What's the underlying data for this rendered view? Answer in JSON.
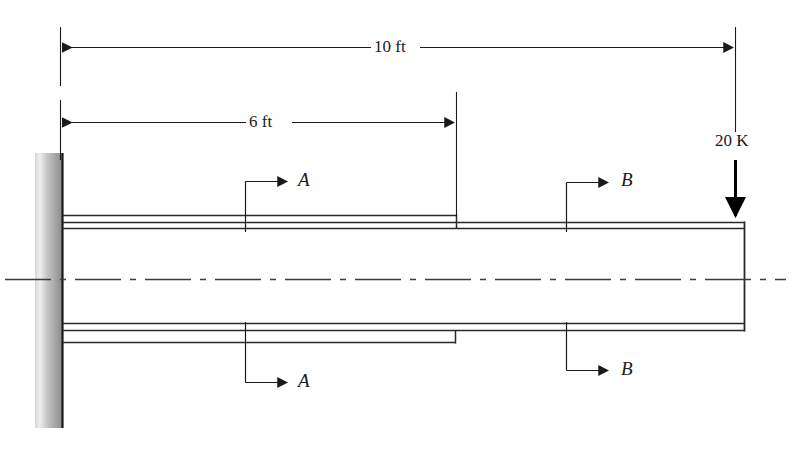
{
  "figure": {
    "background_color": "#ffffff",
    "line_color": "#1a1a1a",
    "wall_color_light": "#e8e8e8",
    "wall_color_dark": "#8a8a8a",
    "width": 793,
    "height": 453
  },
  "dimensions": [
    {
      "name": "overall-length",
      "label": "10 ft",
      "value": 10,
      "unit": "ft",
      "from_x": 60,
      "to_x": 735,
      "y": 47
    },
    {
      "name": "inner-segment-length",
      "label": "6 ft",
      "value": 6,
      "unit": "ft",
      "from_x": 60,
      "to_x": 456,
      "y": 122
    }
  ],
  "load": {
    "label": "20 K",
    "magnitude": 20,
    "unit": "K",
    "direction": "down",
    "x": 735,
    "arrow_top_y": 160,
    "arrow_tip_y": 222
  },
  "sections": [
    {
      "name": "section-a",
      "label": "A",
      "x": 245,
      "top_y": 181,
      "bottom_y": 382
    },
    {
      "name": "section-b",
      "label": "B",
      "x": 566,
      "top_y": 182,
      "bottom_y": 370
    }
  ],
  "support": {
    "name": "fixed-wall-support",
    "type": "fixed",
    "x": 35,
    "width": 27,
    "top_y": 153,
    "bottom_y": 428
  },
  "beam": {
    "name": "hollow-cantilever-beam",
    "left_x": 62,
    "right_x": 745,
    "step_x": 456,
    "outer_top_y": 215,
    "inner_top_outer_y": 222,
    "inner_top_inner_y": 228,
    "inner_bottom_inner_y": 323,
    "inner_bottom_outer_y": 330,
    "outer_bottom_y": 342,
    "centerline_y": 279,
    "centerline_from_x": 5,
    "centerline_to_x": 786
  }
}
